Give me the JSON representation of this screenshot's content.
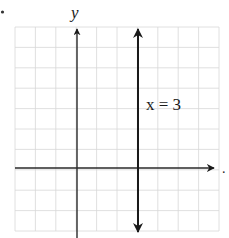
{
  "chart_data": {
    "type": "line",
    "title": "",
    "xlabel": "",
    "ylabel": "y",
    "xlim": [
      -3,
      7
    ],
    "ylim": [
      -3,
      7
    ],
    "grid": true,
    "grid_step": 1,
    "series": [
      {
        "name": "x = 3",
        "kind": "vertical-line",
        "x": [
          3,
          3
        ],
        "y": [
          -3,
          7
        ],
        "arrows": "both",
        "label": "x = 3",
        "label_position": {
          "x": 3.2,
          "y": 3.5
        }
      }
    ],
    "axes": {
      "x_axis": {
        "arrow": "right",
        "trailing_mark": "."
      },
      "y_axis": {
        "arrow": "top",
        "label": "y"
      }
    }
  },
  "labels": {
    "y_axis": "y",
    "line_label": "x = 3",
    "trailing_mark": "."
  },
  "colors": {
    "grid": "#d6d6d6",
    "axis": "#2a2a2a",
    "line": "#1a1a1a",
    "text": "#1a1a1a"
  }
}
